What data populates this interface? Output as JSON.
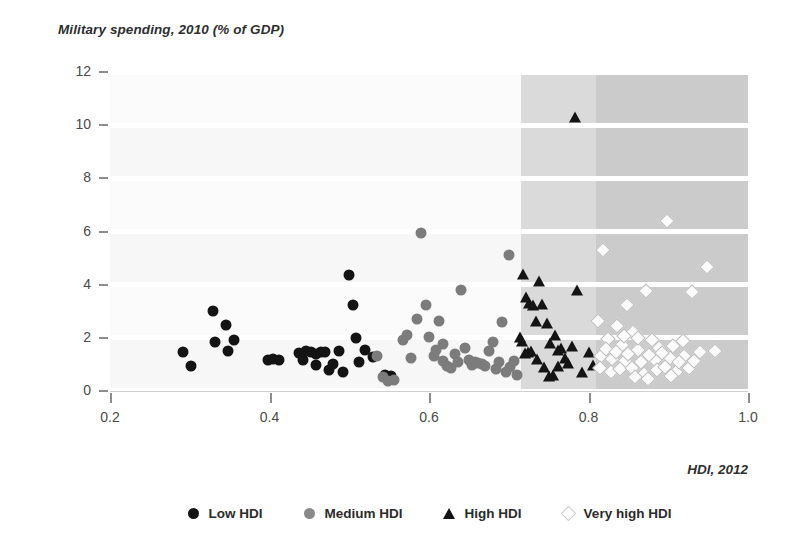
{
  "chart_data": {
    "type": "scatter",
    "title": "Military spending, 2010 (% of GDP)",
    "ylabel": "Military spending, 2010 (% of GDP)",
    "xlabel": "HDI, 2012",
    "xlim": [
      0.2,
      1.0
    ],
    "ylim": [
      0,
      12
    ],
    "xticks": [
      "0.2",
      "0.4",
      "0.6",
      "0.8",
      "1.0"
    ],
    "xtick_values": [
      0.2,
      0.4,
      0.6,
      0.8,
      1.0
    ],
    "yticks": [
      "0",
      "2",
      "4",
      "6",
      "8",
      "10",
      "12"
    ],
    "ytick_values": [
      0,
      2,
      4,
      6,
      8,
      10,
      12
    ],
    "grid": "horizontal-white-bands",
    "legend_position": "bottom-center",
    "shaded_regions": [
      {
        "name": "high-hdi-band",
        "x_from": 0.715,
        "x_to": 0.81,
        "color": "#dadada"
      },
      {
        "name": "very-high-hdi-band",
        "x_from": 0.81,
        "x_to": 1.0,
        "color": "#cbcbcb"
      }
    ],
    "colors": {
      "low": "#141414",
      "medium": "#7c7c7c",
      "high": "#141414",
      "very_high": "#fbfbfb",
      "very_high_outline": "#bdbdbd"
    },
    "series": [
      {
        "name": "Low HDI",
        "marker": "circle-filled-black",
        "points": [
          [
            0.292,
            1.45
          ],
          [
            0.302,
            0.95
          ],
          [
            0.329,
            3.0
          ],
          [
            0.332,
            1.85
          ],
          [
            0.345,
            2.5
          ],
          [
            0.348,
            1.5
          ],
          [
            0.355,
            1.92
          ],
          [
            0.398,
            1.18
          ],
          [
            0.405,
            1.2
          ],
          [
            0.412,
            1.18
          ],
          [
            0.437,
            1.42
          ],
          [
            0.446,
            1.52
          ],
          [
            0.452,
            1.45
          ],
          [
            0.458,
            1.4
          ],
          [
            0.464,
            1.45
          ],
          [
            0.47,
            1.48
          ],
          [
            0.474,
            0.78
          ],
          [
            0.48,
            1.02
          ],
          [
            0.487,
            1.5
          ],
          [
            0.492,
            0.72
          ],
          [
            0.5,
            4.35
          ],
          [
            0.505,
            3.25
          ],
          [
            0.508,
            1.98
          ],
          [
            0.512,
            1.1
          ],
          [
            0.52,
            1.55
          ],
          [
            0.53,
            1.28
          ],
          [
            0.545,
            0.62
          ],
          [
            0.552,
            0.55
          ],
          [
            0.458,
            0.98
          ],
          [
            0.442,
            1.18
          ]
        ]
      },
      {
        "name": "Medium HDI",
        "marker": "circle-filled-gray",
        "points": [
          [
            0.535,
            1.3
          ],
          [
            0.542,
            0.52
          ],
          [
            0.548,
            0.38
          ],
          [
            0.556,
            0.42
          ],
          [
            0.567,
            1.92
          ],
          [
            0.572,
            2.1
          ],
          [
            0.578,
            1.25
          ],
          [
            0.585,
            2.7
          ],
          [
            0.59,
            5.95
          ],
          [
            0.596,
            3.22
          ],
          [
            0.6,
            2.05
          ],
          [
            0.606,
            1.3
          ],
          [
            0.612,
            2.62
          ],
          [
            0.618,
            1.12
          ],
          [
            0.622,
            0.95
          ],
          [
            0.628,
            0.88
          ],
          [
            0.632,
            1.38
          ],
          [
            0.636,
            1.1
          ],
          [
            0.64,
            3.8
          ],
          [
            0.645,
            1.62
          ],
          [
            0.65,
            1.18
          ],
          [
            0.654,
            0.98
          ],
          [
            0.658,
            1.08
          ],
          [
            0.662,
            1.05
          ],
          [
            0.666,
            1.02
          ],
          [
            0.67,
            0.95
          ],
          [
            0.675,
            1.52
          ],
          [
            0.68,
            1.85
          ],
          [
            0.684,
            0.82
          ],
          [
            0.688,
            1.1
          ],
          [
            0.692,
            2.58
          ],
          [
            0.696,
            0.7
          ],
          [
            0.7,
            5.12
          ],
          [
            0.702,
            0.92
          ],
          [
            0.706,
            1.12
          ],
          [
            0.71,
            0.62
          ],
          [
            0.618,
            1.78
          ],
          [
            0.609,
            1.55
          ]
        ]
      },
      {
        "name": "High HDI",
        "marker": "triangle-filled-black",
        "points": [
          [
            0.783,
            10.3
          ],
          [
            0.718,
            4.42
          ],
          [
            0.722,
            3.55
          ],
          [
            0.726,
            3.3
          ],
          [
            0.73,
            3.22
          ],
          [
            0.734,
            2.62
          ],
          [
            0.738,
            4.12
          ],
          [
            0.742,
            3.28
          ],
          [
            0.748,
            2.55
          ],
          [
            0.752,
            1.82
          ],
          [
            0.758,
            2.1
          ],
          [
            0.762,
            1.55
          ],
          [
            0.766,
            1.6
          ],
          [
            0.77,
            1.25
          ],
          [
            0.774,
            1.05
          ],
          [
            0.779,
            1.68
          ],
          [
            0.786,
            3.8
          ],
          [
            0.792,
            0.72
          ],
          [
            0.714,
            2.05
          ],
          [
            0.716,
            1.88
          ],
          [
            0.72,
            1.42
          ],
          [
            0.724,
            1.48
          ],
          [
            0.728,
            1.52
          ],
          [
            0.736,
            1.22
          ],
          [
            0.744,
            0.92
          ],
          [
            0.75,
            0.58
          ],
          [
            0.756,
            0.6
          ],
          [
            0.762,
            0.95
          ],
          [
            0.8,
            1.48
          ],
          [
            0.806,
            0.98
          ]
        ]
      },
      {
        "name": "Very high HDI",
        "marker": "diamond-open-white",
        "points": [
          [
            0.898,
            6.38
          ],
          [
            0.818,
            5.32
          ],
          [
            0.948,
            4.68
          ],
          [
            0.872,
            3.75
          ],
          [
            0.93,
            3.72
          ],
          [
            0.848,
            3.22
          ],
          [
            0.812,
            2.62
          ],
          [
            0.836,
            2.45
          ],
          [
            0.856,
            2.22
          ],
          [
            0.88,
            1.92
          ],
          [
            0.824,
            1.95
          ],
          [
            0.842,
            1.72
          ],
          [
            0.862,
            1.55
          ],
          [
            0.888,
            1.62
          ],
          [
            0.906,
            1.7
          ],
          [
            0.816,
            1.32
          ],
          [
            0.83,
            1.22
          ],
          [
            0.846,
            1.12
          ],
          [
            0.866,
            1.08
          ],
          [
            0.884,
            1.18
          ],
          [
            0.902,
            1.25
          ],
          [
            0.92,
            1.32
          ],
          [
            0.94,
            1.45
          ],
          [
            0.958,
            1.5
          ],
          [
            0.814,
            0.88
          ],
          [
            0.828,
            0.72
          ],
          [
            0.84,
            0.82
          ],
          [
            0.854,
            0.88
          ],
          [
            0.87,
            0.65
          ],
          [
            0.886,
            0.78
          ],
          [
            0.896,
            0.92
          ],
          [
            0.91,
            0.72
          ],
          [
            0.926,
            0.85
          ],
          [
            0.822,
            1.58
          ],
          [
            0.834,
            1.45
          ],
          [
            0.85,
            1.38
          ],
          [
            0.876,
            1.35
          ],
          [
            0.892,
            1.42
          ],
          [
            0.914,
            1.08
          ],
          [
            0.932,
            1.12
          ],
          [
            0.858,
            0.52
          ],
          [
            0.874,
            0.45
          ],
          [
            0.904,
            0.58
          ],
          [
            0.918,
            1.88
          ],
          [
            0.862,
            2.0
          ],
          [
            0.844,
            2.08
          ]
        ]
      }
    ]
  },
  "legend": {
    "items": [
      {
        "label": "Low HDI",
        "marker": "circle-filled-black"
      },
      {
        "label": "Medium HDI",
        "marker": "circle-filled-gray"
      },
      {
        "label": "High HDI",
        "marker": "triangle-filled-black"
      },
      {
        "label": "Very high HDI",
        "marker": "diamond-open-white"
      }
    ]
  }
}
